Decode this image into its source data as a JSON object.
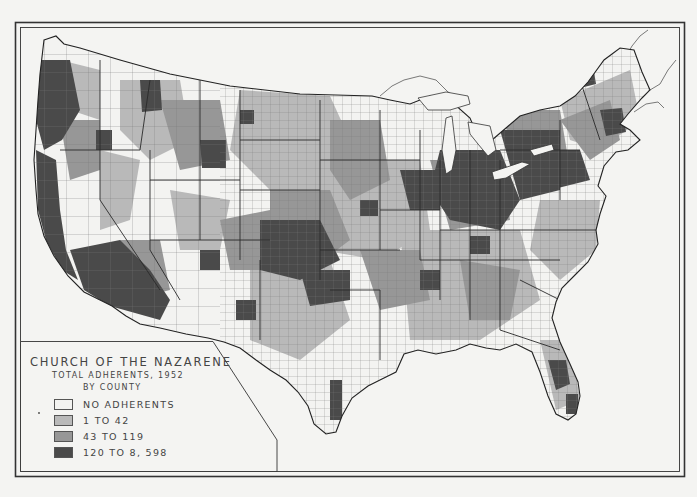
{
  "map": {
    "title": "CHURCH OF THE NAZARENE",
    "subtitle": "TOTAL ADHERENTS, 1952",
    "subtitle2": "BY COUNTY",
    "region": "Contiguous United States",
    "colors": {
      "background": "#f4f4f2",
      "border": "#333333",
      "state_line": "#2a2a2a",
      "county_line": "#6a6a6a"
    }
  },
  "legend": {
    "items": [
      {
        "label": "NO ADHERENTS",
        "color": "#f3f3f1"
      },
      {
        "label": "1 TO 42",
        "color": "#b9b9b9"
      },
      {
        "label": "43 TO 119",
        "color": "#979797"
      },
      {
        "label": "120 TO 8, 598",
        "color": "#4a4a4a"
      }
    ]
  }
}
